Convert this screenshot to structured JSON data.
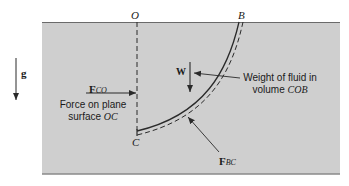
{
  "diagram": {
    "colors": {
      "fluid": "#cfcfcf",
      "line": "#2a2a2a",
      "background": "#ffffff"
    },
    "points": {
      "O": "O",
      "B": "B",
      "C": "C"
    },
    "gravity": {
      "symbol": "g"
    },
    "force_co": {
      "symbol": "F",
      "subscript": "CO",
      "label_line1": "Force on plane",
      "label_line2_prefix": "surface ",
      "label_line2_italic": "OC"
    },
    "weight": {
      "symbol": "W",
      "label_line1": "Weight of fluid in",
      "label_line2_prefix": "volume ",
      "label_line2_italic": "COB"
    },
    "force_bc": {
      "symbol": "F",
      "subscript": "BC"
    }
  }
}
